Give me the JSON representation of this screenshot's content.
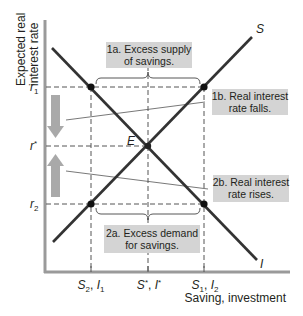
{
  "diagram": {
    "y_axis_label_line1": "Expected real",
    "y_axis_label_line2": "interest rate",
    "x_axis_label": "Saving, investment",
    "curves": {
      "saving": {
        "label": "S",
        "color": "#3a3a3a"
      },
      "investment": {
        "label": "I",
        "color": "#3a3a3a"
      }
    },
    "equilibrium_label": "E",
    "y_ticks": {
      "r1": {
        "base": "r",
        "sub": "1"
      },
      "rstar": {
        "base": "r",
        "sup": "*"
      },
      "r2": {
        "base": "r",
        "sub": "2"
      }
    },
    "x_ticks": {
      "left": {
        "a": "S",
        "a_sub": "2",
        "sep": ", ",
        "b": "I",
        "b_sub": "1"
      },
      "mid": {
        "a": "S",
        "a_sup": "*",
        "sep": ", ",
        "b": "I",
        "b_sup": "*"
      },
      "right": {
        "a": "S",
        "a_sub": "1",
        "sep": ", ",
        "b": "I",
        "b_sub": "2"
      }
    },
    "annotations": {
      "a1_line1": "1a. Excess supply",
      "a1_line2": "of savings.",
      "b1_line1": "1b. Real interest",
      "b1_line2": "rate falls.",
      "a2_line1": "2a. Excess demand",
      "a2_line2": "for savings.",
      "b2_line1": "2b. Real interest",
      "b2_line2": "rate rises."
    },
    "colors": {
      "axis": "#9a9a9a",
      "curve": "#333333",
      "annotation_box": "#d4d4d4",
      "arrow": "#a9a9a9",
      "dashed": "#555555"
    }
  }
}
